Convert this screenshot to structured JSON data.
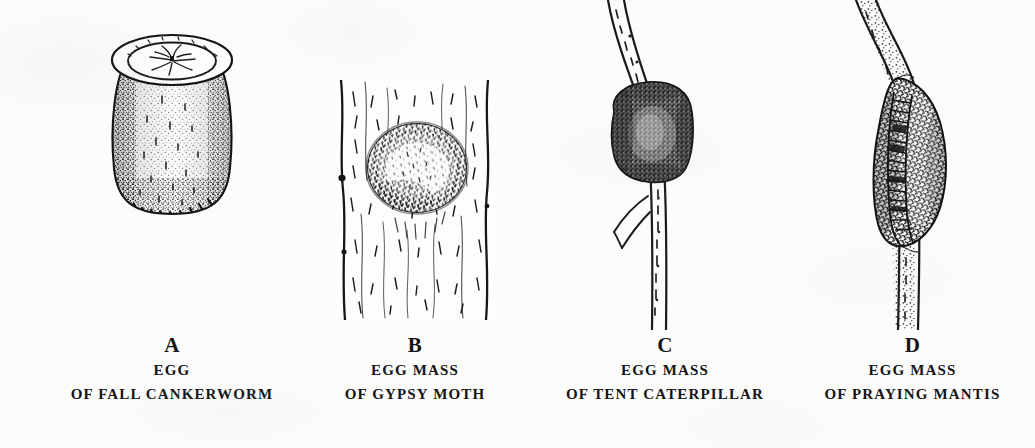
{
  "plate": {
    "background_color": "#fcfcfb",
    "ink_color": "#1a1a1a",
    "width": 1035,
    "height": 448
  },
  "figures": [
    {
      "letter": "A",
      "line1": "EGG",
      "line2": "OF FALL CANKERWORM",
      "subject": "egg-of-fall-cankerworm",
      "art_name": "cankerworm-egg-illustration",
      "description": "barrel-shaped egg with flat stippled circular top"
    },
    {
      "letter": "B",
      "line1": "EGG MASS",
      "line2": "OF GYPSY MOTH",
      "subject": "egg-mass-of-gypsy-moth",
      "art_name": "gypsy-moth-egg-mass-illustration",
      "description": "oval hairy egg mass on vertically striated tree bark"
    },
    {
      "letter": "C",
      "line1": "EGG MASS",
      "line2": "OF TENT CATERPILLAR",
      "subject": "egg-mass-of-tent-caterpillar",
      "art_name": "tent-caterpillar-egg-mass-illustration",
      "description": "dark stippled collar encircling a slender twig with side branch"
    },
    {
      "letter": "D",
      "line1": "EGG MASS",
      "line2": "OF PRAYING MANTIS",
      "subject": "egg-mass-of-praying-mantis",
      "art_name": "praying-mantis-ootheca-illustration",
      "description": "spindle-shaped ootheca on a twig with central ridged emergence band"
    }
  ]
}
